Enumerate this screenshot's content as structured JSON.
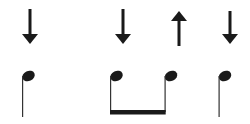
{
  "diagram": {
    "type": "strumming-pattern",
    "colors": {
      "ink": "#1a1a1a",
      "background": "#ffffff"
    },
    "arrows": [
      {
        "direction": "down",
        "x": 30
      },
      {
        "direction": "down",
        "x": 123
      },
      {
        "direction": "up",
        "x": 179
      },
      {
        "direction": "down",
        "x": 230
      }
    ],
    "notes": [
      {
        "kind": "quarter",
        "head_x": 29,
        "stem_x": 23
      },
      {
        "kind": "eighth-beamed",
        "head_x": 117,
        "stem_x": 111
      },
      {
        "kind": "eighth-beamed",
        "head_x": 171,
        "stem_x": 165
      },
      {
        "kind": "quarter",
        "head_x": 225,
        "stem_x": 219
      }
    ],
    "beams": [
      {
        "from_note": 1,
        "to_note": 2
      }
    ]
  }
}
